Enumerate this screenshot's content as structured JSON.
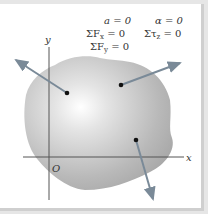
{
  "diagram": {
    "equations": {
      "eq1": "a = 0",
      "eq2": "α = 0",
      "eq3": "ΣF",
      "eq3_sub": "x",
      "eq3_rest": " = 0",
      "eq4": "Στ",
      "eq4_sub": "z",
      "eq4_rest": " = 0",
      "eq5": "ΣF",
      "eq5_sub": "y",
      "eq5_rest": " = 0"
    },
    "axes": {
      "x_label": "x",
      "y_label": "y",
      "origin_label": "O"
    },
    "colors": {
      "body": "#b8b8b8",
      "arrow": "#7a8a98",
      "axis": "#555555"
    }
  }
}
